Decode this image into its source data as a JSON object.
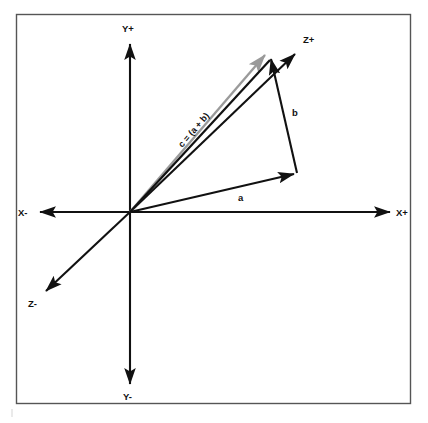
{
  "figure": {
    "background_color": "#ffffff",
    "border_color": "#555555",
    "frame": {
      "x": 16,
      "y": 14,
      "width": 395,
      "height": 390
    }
  },
  "axes": {
    "origin": {
      "x": 130,
      "y": 212
    },
    "color": "#111111",
    "items": [
      {
        "name": "y-positive",
        "label": "Y+",
        "tip": {
          "x": 130,
          "y": 42
        },
        "label_pos": {
          "x": 122,
          "y": 32
        }
      },
      {
        "name": "y-negative",
        "label": "Y-",
        "tip": {
          "x": 130,
          "y": 386
        },
        "label_pos": {
          "x": 123,
          "y": 400
        }
      },
      {
        "name": "x-negative",
        "label": "X-",
        "tip": {
          "x": 38,
          "y": 212
        },
        "label_pos": {
          "x": 18,
          "y": 216
        }
      },
      {
        "name": "x-positive",
        "label": "X+",
        "tip": {
          "x": 392,
          "y": 212
        },
        "label_pos": {
          "x": 396,
          "y": 216
        }
      },
      {
        "name": "z-positive",
        "label": "Z+",
        "tip": {
          "x": 297,
          "y": 52
        },
        "label_pos": {
          "x": 303,
          "y": 43
        }
      },
      {
        "name": "z-negative",
        "label": "Z-",
        "tip": {
          "x": 44,
          "y": 293
        },
        "label_pos": {
          "x": 28,
          "y": 307
        }
      }
    ]
  },
  "vectors": [
    {
      "name": "vector-a",
      "label": "a",
      "color": "#111111",
      "start": {
        "x": 130,
        "y": 212
      },
      "end": {
        "x": 297,
        "y": 173
      },
      "label_pos": {
        "x": 238,
        "y": 201
      }
    },
    {
      "name": "vector-b",
      "label": "b",
      "color": "#111111",
      "start": {
        "x": 297,
        "y": 173
      },
      "end": {
        "x": 270,
        "y": 56
      },
      "label_pos": {
        "x": 292,
        "y": 116
      }
    },
    {
      "name": "vector-c-black",
      "label": "",
      "color": "#111111",
      "start": {
        "x": 130,
        "y": 212
      },
      "end": {
        "x": 272,
        "y": 58
      },
      "label_pos": null
    },
    {
      "name": "vector-c-resultant",
      "label": "c = (a + b)",
      "color": "#9a9a9a",
      "start": {
        "x": 130,
        "y": 212
      },
      "end": {
        "x": 263,
        "y": 53
      },
      "label_pos": {
        "x": 196,
        "y": 132
      },
      "label_rotation": -50
    }
  ],
  "legend": {
    "equation": "c = (a + b)",
    "vector_a_name": "a",
    "vector_b_name": "b"
  }
}
